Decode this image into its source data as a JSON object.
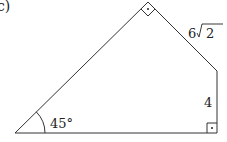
{
  "figure": {
    "part_label": "c)",
    "angle_label": "45°",
    "side_labels": {
      "slant_coefficient": "6",
      "slant_radicand": "2",
      "vertical": "4"
    },
    "right_angles": [
      "top vertex",
      "bottom-right vertex"
    ],
    "stroke_color": "#333333",
    "background": "#ffffff"
  }
}
